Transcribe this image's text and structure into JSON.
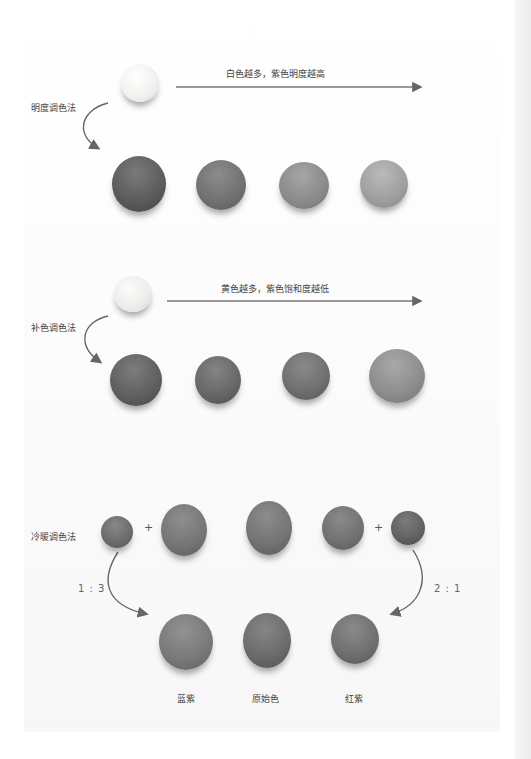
{
  "section_value": {
    "title": "明度调色法",
    "caption": "白色越多，紫色明度越高",
    "source_ball_color": "#f2f2f0",
    "balls": [
      {
        "color": "#5a5a5a"
      },
      {
        "color": "#707070"
      },
      {
        "color": "#8a8a8a"
      },
      {
        "color": "#9e9e9e"
      }
    ]
  },
  "section_complement": {
    "title": "补色调色法",
    "caption": "黄色越多，紫色饱和度越低",
    "source_ball_color": "#ececea",
    "balls": [
      {
        "color": "#5e5e5e"
      },
      {
        "color": "#666666"
      },
      {
        "color": "#6e6e6e"
      },
      {
        "color": "#8c8c8c"
      }
    ]
  },
  "section_temperature": {
    "title": "冷暖调色法",
    "plus_symbol": "+",
    "ratio_left": "1 : 3",
    "ratio_right": "2 : 1",
    "top_balls": [
      {
        "color": "#6a6a6a"
      },
      {
        "color": "#747474"
      },
      {
        "color": "#727272"
      },
      {
        "color": "#707070"
      },
      {
        "color": "#606060"
      }
    ],
    "results": [
      {
        "label": "蓝紫",
        "color": "#787878"
      },
      {
        "label": "原始色",
        "color": "#6a6a6a"
      },
      {
        "label": "红紫",
        "color": "#6e6e6e"
      }
    ]
  }
}
